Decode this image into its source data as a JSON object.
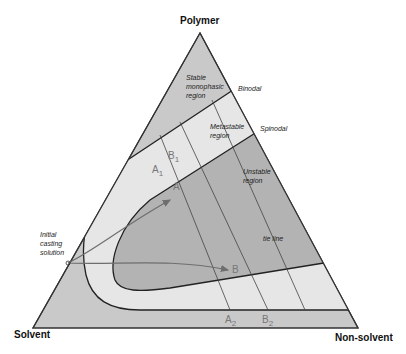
{
  "diagram": {
    "type": "ternary-phase-diagram",
    "vertices": {
      "top": "Polymer",
      "bottom_left": "Solvent",
      "bottom_right": "Non-solvent"
    },
    "regions": {
      "stable": [
        "Stable",
        "monophasic",
        "region"
      ],
      "metastable": [
        "Metastable",
        "region"
      ],
      "unstable": [
        "Unstable",
        "region"
      ]
    },
    "curves": {
      "binodal": "Binodal",
      "spinodal": "Spinodal",
      "tie_line": "tie line"
    },
    "start_point": [
      "Initial",
      "casting",
      "solution"
    ],
    "points": {
      "A": "A",
      "B": "B",
      "A1": {
        "main": "A",
        "sub": "1"
      },
      "B1": {
        "main": "B",
        "sub": "1"
      },
      "A2": {
        "main": "A",
        "sub": "2"
      },
      "B2": {
        "main": "B",
        "sub": "2"
      }
    },
    "colors": {
      "stable": "#c9c9c9",
      "metastable": "#e6e6e6",
      "unstable": "#b3b3b3",
      "outline": "#333333",
      "arrow": "#6e6e6e",
      "point_label": "#7a7a7a"
    }
  }
}
